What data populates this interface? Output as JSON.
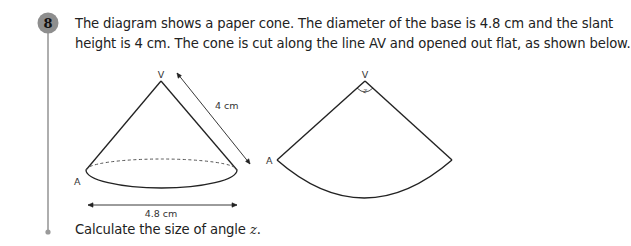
{
  "question": {
    "number": "8",
    "line1": "The diagram shows a paper cone. The diameter of the base is 4.8 cm and the slant",
    "line2": "height is 4 cm. The cone is cut along the line AV and opened out flat, as shown below.",
    "prompt_prefix": "Calculate the size of angle ",
    "prompt_variable": "z",
    "prompt_suffix": "."
  },
  "cone_diagram": {
    "apex_label": "V",
    "base_point_label": "A",
    "slant_height_label": "4 cm",
    "diameter_label": "4.8 cm"
  },
  "sector_diagram": {
    "apex_label": "V",
    "edge_point_label": "A",
    "angle_label": "z"
  },
  "colors": {
    "badge_fill": "#8e8e8e",
    "badge_line": "#9a9a9a",
    "ink": "#222222"
  }
}
